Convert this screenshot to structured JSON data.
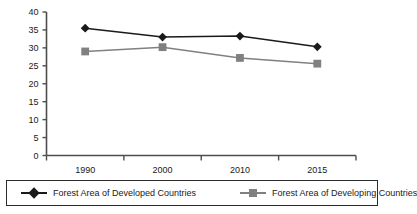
{
  "chart_data": {
    "type": "line",
    "title": "",
    "subtitle": "",
    "xlabel": "",
    "ylabel": "",
    "categories": [
      "1990",
      "2000",
      "2010",
      "2015"
    ],
    "series": [
      {
        "name": "Forest Area of Developed Countries",
        "values": [
          35.5,
          33.0,
          33.3,
          30.3
        ],
        "color": "#1a1a1a",
        "marker": "diamond"
      },
      {
        "name": "Forest Area of Developing Countries",
        "values": [
          29.0,
          30.2,
          27.2,
          25.6
        ],
        "color": "#808080",
        "marker": "square"
      }
    ],
    "ylim": [
      0,
      40
    ],
    "ytick_step": 5,
    "ytick_labels": [
      "0",
      "5",
      "10",
      "15",
      "20",
      "25",
      "30",
      "35",
      "40"
    ],
    "xtick_labels": [
      "1990",
      "2000",
      "2010",
      "2015"
    ],
    "grid": false,
    "legend_position": "bottom"
  },
  "legend": {
    "items": [
      {
        "label": "Forest Area of Developed Countries",
        "marker": "diamond-marker",
        "color": "#1a1a1a"
      },
      {
        "label": "Forest Area of Developing Countries",
        "marker": "square-marker",
        "color": "#808080"
      }
    ]
  },
  "colors": {
    "developed": "#1a1a1a",
    "developing": "#808080",
    "axis": "#4d4d4d",
    "background": "#ffffff",
    "legend_border": "#2b2b2b"
  }
}
